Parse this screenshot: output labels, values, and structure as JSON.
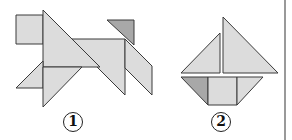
{
  "figures": [
    {
      "id": "figure-1",
      "label": "1",
      "subject": "dog tangram",
      "label_pos": {
        "x": 73,
        "y": 112
      }
    },
    {
      "id": "figure-2",
      "label": "2",
      "subject": "sailboat tangram",
      "label_pos": {
        "x": 221,
        "y": 112
      }
    }
  ],
  "colors": {
    "light_fill": "#dcdcdc",
    "dark_fill": "#a8a8a8",
    "stroke": "#3a3a3a",
    "divider": "#777777"
  }
}
